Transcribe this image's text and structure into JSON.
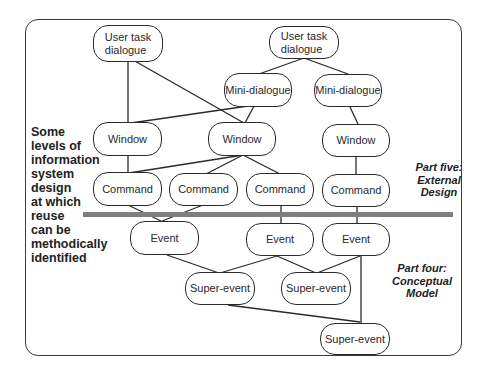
{
  "diagram": {
    "side_label": {
      "lines": [
        "Some",
        "levels of",
        "information",
        "system",
        "design",
        "at which",
        "reuse",
        "can be",
        "methodically",
        "identified"
      ]
    },
    "part_five": {
      "lines": [
        "Part five:",
        "External",
        "Design"
      ]
    },
    "part_four": {
      "lines": [
        "Part four:",
        "Conceptual",
        "Model"
      ]
    },
    "nodes": {
      "user_task_1": {
        "lines": [
          "User task",
          "dialogue"
        ]
      },
      "user_task_2": {
        "lines": [
          "User task",
          "dialogue"
        ]
      },
      "mini_dialogue_1": {
        "label": "Mini-dialogue"
      },
      "mini_dialogue_2": {
        "label": "Mini-dialogue"
      },
      "window_1": {
        "label": "Window"
      },
      "window_2": {
        "label": "Window"
      },
      "window_3": {
        "label": "Window"
      },
      "command_1": {
        "label": "Command"
      },
      "command_2": {
        "label": "Command"
      },
      "command_3": {
        "label": "Command"
      },
      "command_4": {
        "label": "Command"
      },
      "event_1": {
        "label": "Event"
      },
      "event_2": {
        "label": "Event"
      },
      "event_3": {
        "label": "Event"
      },
      "super_event_1": {
        "label": "Super-event"
      },
      "super_event_2": {
        "label": "Super-event"
      },
      "super_event_3": {
        "label": "Super-event"
      }
    },
    "colors": {
      "stroke": "#2a2a2a",
      "reuse_bar": "#7f7f7f",
      "background": "#ffffff"
    }
  }
}
